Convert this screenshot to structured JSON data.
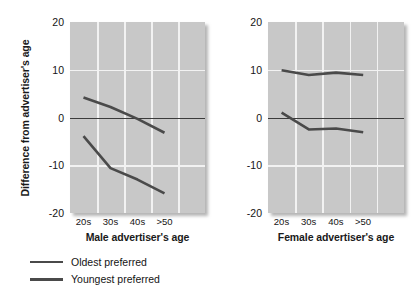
{
  "chart_data": {
    "type": "line",
    "title": "",
    "ylabel": "Difference from advertiser's age",
    "ylim": [
      -20,
      20
    ],
    "yticks": [
      20,
      10,
      0,
      -10,
      -20
    ],
    "grid": true,
    "legend_position": "below-left",
    "legend": [
      "Oldest preferred",
      "Youngest preferred"
    ],
    "panels": [
      {
        "xlabel": "Male advertiser's age",
        "categories": [
          "20s",
          "30s",
          "40s",
          ">50"
        ],
        "series": [
          {
            "name": "Oldest preferred",
            "values": [
              4.2,
              2.2,
              -0.3,
              -3.2
            ]
          },
          {
            "name": "Youngest preferred",
            "values": [
              -3.9,
              -10.6,
              -13.0,
              -15.9
            ]
          }
        ]
      },
      {
        "xlabel": "Female advertiser's age",
        "categories": [
          "20s",
          "30s",
          "40s",
          ">50"
        ],
        "series": [
          {
            "name": "Oldest preferred",
            "values": [
              9.9,
              8.9,
              9.4,
              8.9
            ]
          },
          {
            "name": "Youngest preferred",
            "values": [
              1.0,
              -2.5,
              -2.3,
              -3.1
            ]
          }
        ]
      }
    ],
    "colors": {
      "plot_background": "#c8c8c8",
      "gridline": "#f2f2f2",
      "series_line": "#4a4a4a",
      "zero_line": "#3b3b3b",
      "text": "#141414"
    }
  }
}
